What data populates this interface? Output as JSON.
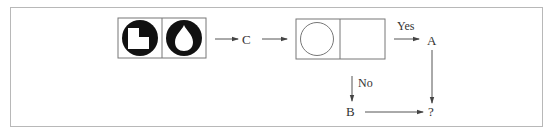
{
  "diagram": {
    "type": "flowchart-puzzle",
    "colors": {
      "frame": "#b8b8b8",
      "line": "#555555",
      "fill_dark": "#111111",
      "text": "#333333"
    },
    "start_box": {
      "cells": [
        {
          "icon": "circle-with-square-cutout-icon",
          "description": "black circle with white L-shaped notch"
        },
        {
          "icon": "ring-with-drop-icon",
          "description": "black ring with white teardrop inside"
        }
      ]
    },
    "nodes": {
      "c": "C",
      "a": "A",
      "b": "B",
      "result": "?"
    },
    "decision_box": {
      "cells": [
        {
          "icon": "circle-outline-icon",
          "description": "empty circle outline"
        },
        {
          "icon": "empty-cell",
          "description": "blank cell"
        }
      ]
    },
    "edge_labels": {
      "yes": "Yes",
      "no": "No"
    }
  }
}
